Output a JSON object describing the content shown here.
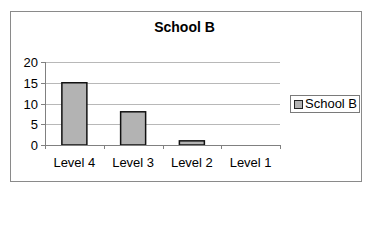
{
  "chart_data": {
    "type": "bar",
    "title": "School B",
    "categories": [
      "Level 4",
      "Level 3",
      "Level 2",
      "Level 1"
    ],
    "series": [
      {
        "name": "School B",
        "values": [
          15,
          8,
          1,
          0
        ],
        "color": "#b3b3b3"
      }
    ],
    "xlabel": "",
    "ylabel": "",
    "ylim": [
      0,
      20
    ],
    "yticks": [
      "0",
      "5",
      "10",
      "15",
      "20"
    ],
    "grid": true,
    "legend_position": "right"
  }
}
